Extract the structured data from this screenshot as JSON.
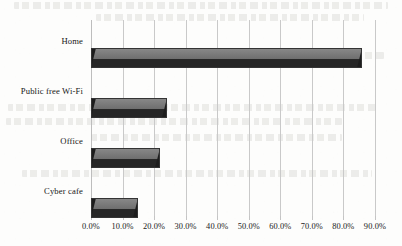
{
  "chart_data": {
    "type": "bar",
    "orientation": "horizontal",
    "title": "",
    "xlabel": "",
    "ylabel": "",
    "categories": [
      "Home",
      "Public free Wi-Fi",
      "Office",
      "Cyber cafe"
    ],
    "values": [
      86.0,
      24.0,
      22.0,
      15.0
    ],
    "value_format": "percent",
    "xlim": [
      0,
      90
    ],
    "xticks": [
      0,
      10,
      20,
      30,
      40,
      50,
      60,
      70,
      80,
      90
    ],
    "xtick_labels": [
      "0.0%",
      "10.0%",
      "20.0%",
      "30.0%",
      "40.0%",
      "50.0%",
      "60.0%",
      "70.0%",
      "80.0%",
      "90.0%"
    ],
    "grid": true,
    "grid_axis": "x",
    "legend": false,
    "style": "3d-bar",
    "colors": {
      "bar_top": "#7b7b7b",
      "bar_front": "#262626",
      "bar_bevel": "#1d1d1d",
      "gridline": "#c9c9c9",
      "text": "#171717",
      "background": "#fdfdfc"
    }
  }
}
